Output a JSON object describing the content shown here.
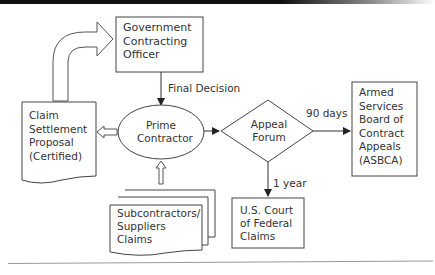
{
  "diagram": {
    "type": "flowchart",
    "nodes": {
      "officer": {
        "label": "Government\nContracting\nOfficer",
        "shape": "rectangle"
      },
      "claim": {
        "label": "Claim\nSettlement\nProposal\n(Certified)",
        "shape": "document"
      },
      "prime": {
        "label": "Prime\nContractor",
        "shape": "ellipse"
      },
      "subs": {
        "label": "Subcontractors/\nSuppliers\nClaims",
        "shape": "multi-document"
      },
      "forum": {
        "label": "Appeal\nForum",
        "shape": "diamond"
      },
      "asbca": {
        "label": "Armed\nServices\nBoard of\nContract\nAppeals\n(ASBCA)",
        "shape": "rectangle"
      },
      "court": {
        "label": "U.S. Court\nof Federal\nClaims",
        "shape": "rectangle"
      }
    },
    "edges": {
      "claim_to_officer": {
        "from": "claim",
        "to": "officer",
        "label": "",
        "style": "curved block arrow"
      },
      "officer_to_prime": {
        "from": "officer",
        "to": "prime",
        "label": "Final Decision"
      },
      "prime_to_claim": {
        "from": "prime",
        "to": "claim",
        "label": "",
        "style": "hollow arrow"
      },
      "subs_to_prime": {
        "from": "subs",
        "to": "prime",
        "label": "",
        "style": "hollow arrow"
      },
      "prime_to_forum": {
        "from": "prime",
        "to": "forum",
        "label": ""
      },
      "forum_to_asbca": {
        "from": "forum",
        "to": "asbca",
        "label": "90 days"
      },
      "forum_to_court": {
        "from": "forum",
        "to": "court",
        "label": "1 year"
      }
    },
    "colors": {
      "stroke": "#444444",
      "text": "#333333",
      "background": "#ffffff"
    }
  }
}
